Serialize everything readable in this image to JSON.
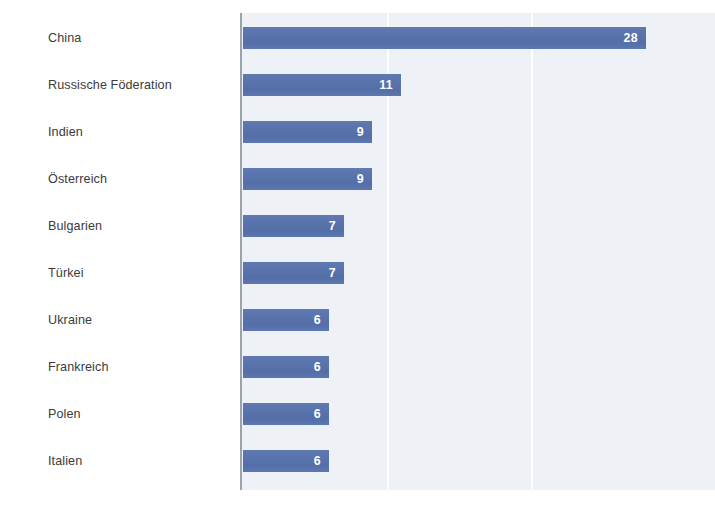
{
  "chart_data": {
    "type": "bar",
    "orientation": "horizontal",
    "title": "",
    "subtitle": "",
    "xlabel": "",
    "ylabel": "",
    "categories": [
      "China",
      "Russische Föderation",
      "Indien",
      "Österreich",
      "Bulgarien",
      "Türkei",
      "Ukraine",
      "Frankreich",
      "Polen",
      "Italien"
    ],
    "values": [
      28,
      11,
      9,
      9,
      7,
      7,
      6,
      6,
      6,
      6
    ],
    "value_labels": [
      "28",
      "11",
      "9",
      "9",
      "7",
      "7",
      "6",
      "6",
      "6",
      "6"
    ],
    "xlim": [
      0,
      32
    ],
    "grid": true,
    "gridlines_at": [
      10,
      20
    ],
    "legend": false,
    "legend_position": "none",
    "tick_labels": [],
    "annotations": [],
    "colors": {
      "bar": "#5a74ad",
      "plot_background": "#eef2f6",
      "page_background": "#ffffff",
      "axis_line": "#9ba4ac",
      "gridline": "#fbfdff",
      "category_label_text": "#3b3b3b",
      "value_label_text": "#ffffff"
    }
  }
}
